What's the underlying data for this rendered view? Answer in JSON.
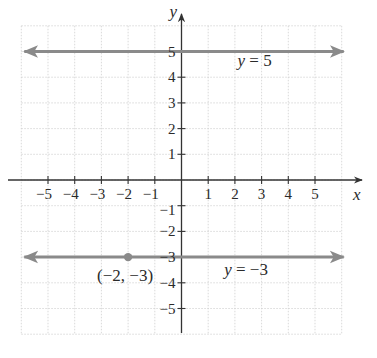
{
  "graph": {
    "axes": {
      "x_label": "x",
      "y_label": "y",
      "x_ticks": [
        {
          "v": -5,
          "label": "−5"
        },
        {
          "v": -4,
          "label": "−4"
        },
        {
          "v": -3,
          "label": "−3"
        },
        {
          "v": -2,
          "label": "−2"
        },
        {
          "v": -1,
          "label": "−1"
        },
        {
          "v": 1,
          "label": "1"
        },
        {
          "v": 2,
          "label": "2"
        },
        {
          "v": 3,
          "label": "3"
        },
        {
          "v": 4,
          "label": "4"
        },
        {
          "v": 5,
          "label": "5"
        }
      ],
      "y_ticks": [
        {
          "v": 5,
          "label": "5"
        },
        {
          "v": 4,
          "label": "4"
        },
        {
          "v": 3,
          "label": "3"
        },
        {
          "v": 2,
          "label": "2"
        },
        {
          "v": 1,
          "label": "1"
        },
        {
          "v": -1,
          "label": "−1"
        },
        {
          "v": -2,
          "label": "−2"
        },
        {
          "v": -3,
          "label": "−3"
        },
        {
          "v": -4,
          "label": "−4"
        },
        {
          "v": -5,
          "label": "−5"
        }
      ]
    },
    "lines": [
      {
        "name": "line-y-5",
        "equation_var": "y",
        "equation_rest": " = 5",
        "y": 5
      },
      {
        "name": "line-y-neg3",
        "equation_var": "y",
        "equation_rest": " = −3",
        "y": -3
      }
    ],
    "point": {
      "x": -2,
      "y": -3,
      "label": "(−2, −3)"
    },
    "colors": {
      "axis": "#333333",
      "line": "#8a8a8a",
      "grid": "#cfcfcf",
      "point": "#8a8a8a",
      "text": "#2a2a2a"
    }
  },
  "chart_data": {
    "type": "line",
    "title": "",
    "xlabel": "x",
    "ylabel": "y",
    "xlim": [
      -6,
      6
    ],
    "ylim": [
      -6,
      6
    ],
    "grid": true,
    "series": [
      {
        "name": "y = 5",
        "x": [
          -6,
          6
        ],
        "values": [
          5,
          5
        ],
        "arrows": "both"
      },
      {
        "name": "y = −3",
        "x": [
          -6,
          6
        ],
        "values": [
          -3,
          -3
        ],
        "arrows": "both"
      }
    ],
    "annotations": [
      {
        "type": "point",
        "x": -2,
        "y": -3,
        "text": "(−2, −3)"
      },
      {
        "type": "label",
        "text": "y = 5",
        "near": [
          3,
          4.5
        ]
      },
      {
        "type": "label",
        "text": "y = −3",
        "near": [
          2.5,
          -3.6
        ]
      }
    ]
  }
}
